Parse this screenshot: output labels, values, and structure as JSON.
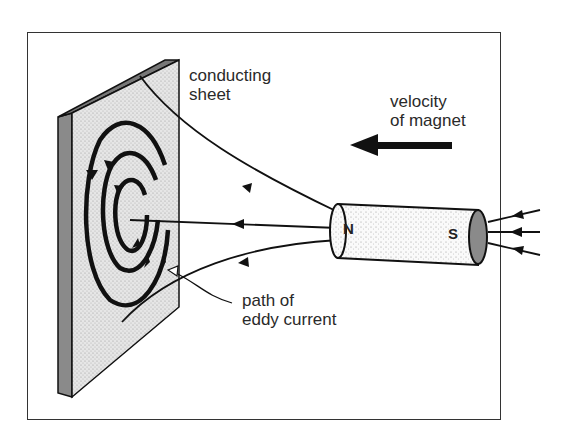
{
  "labels": {
    "sheet": [
      "conducting",
      "sheet"
    ],
    "velocity": [
      "velocity",
      "of magnet"
    ],
    "eddy": [
      "path of",
      "eddy current"
    ]
  },
  "magnet": {
    "north": "N",
    "south": "S"
  },
  "colors": {
    "line": "#111111",
    "sheet_face": "#d4d4d4",
    "sheet_edge": "#8a8a8a",
    "magnet_end": "#8a8a8a"
  }
}
